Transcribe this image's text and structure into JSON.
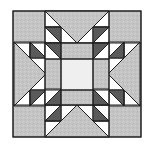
{
  "figure": {
    "type": "star quilt block",
    "colors": {
      "background": "#ffffff",
      "medium_gray": "#c4c4c4",
      "dark_gray": "#5a5a5a",
      "white_piece": "#ffffff",
      "center_light": "#efefef",
      "outline": "#1e1e1e"
    },
    "grid": {
      "origin_x": 13,
      "origin_y": 11,
      "size": 128
    }
  }
}
